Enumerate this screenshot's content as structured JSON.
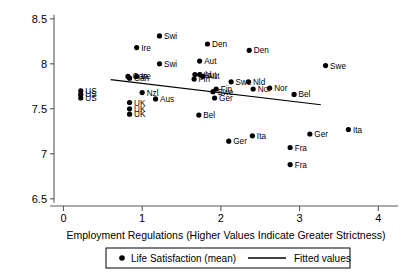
{
  "chart_data": {
    "type": "scatter",
    "title": "",
    "xlabel": "Employment Regulations (Higher Values Indicate Greater Strictness)",
    "ylabel": "",
    "xlim": [
      -0.12,
      4.25
    ],
    "ylim": [
      6.42,
      8.62
    ],
    "xticks": [
      "0",
      "1",
      "2",
      "3",
      "4"
    ],
    "xtick_values": [
      0,
      1,
      2,
      3,
      4
    ],
    "yticks": [
      "6.5",
      "7",
      "7.5",
      "8",
      "8.5"
    ],
    "ytick_values": [
      6.5,
      7,
      7.5,
      8,
      8.5
    ],
    "grid": false,
    "legend_position": "bottom-center",
    "legend": [
      {
        "marker": "circle",
        "label": "Life Satisfaction (mean)"
      },
      {
        "marker": "line",
        "label": "Fitted values"
      }
    ],
    "series": [
      {
        "name": "Life Satisfaction (mean)",
        "marker": "circle",
        "color": "#000000",
        "points": [
          {
            "label": "US",
            "x": 0.22,
            "y": 7.7
          },
          {
            "label": "US",
            "x": 0.22,
            "y": 7.66
          },
          {
            "label": "US",
            "x": 0.22,
            "y": 7.62
          },
          {
            "label": "Swi",
            "x": 1.22,
            "y": 8.31
          },
          {
            "label": "Ire",
            "x": 0.93,
            "y": 8.18
          },
          {
            "label": "Swi",
            "x": 1.22,
            "y": 8.0
          },
          {
            "label": "Can",
            "x": 0.82,
            "y": 7.86
          },
          {
            "label": "Can",
            "x": 0.84,
            "y": 7.84
          },
          {
            "label": "Ire",
            "x": 0.93,
            "y": 7.86
          },
          {
            "label": "Nzl",
            "x": 1.0,
            "y": 7.68
          },
          {
            "label": "Aus",
            "x": 1.17,
            "y": 7.61
          },
          {
            "label": "UK",
            "x": 0.84,
            "y": 7.57
          },
          {
            "label": "UK",
            "x": 0.84,
            "y": 7.5
          },
          {
            "label": "UK",
            "x": 0.84,
            "y": 7.44
          },
          {
            "label": "Den",
            "x": 1.83,
            "y": 8.22
          },
          {
            "label": "Den",
            "x": 2.36,
            "y": 8.15
          },
          {
            "label": "Aut",
            "x": 1.73,
            "y": 8.03
          },
          {
            "label": "Swe",
            "x": 3.33,
            "y": 7.98
          },
          {
            "label": "Nld",
            "x": 1.67,
            "y": 7.88
          },
          {
            "label": "Aut",
            "x": 1.73,
            "y": 7.88
          },
          {
            "label": "Fin",
            "x": 1.66,
            "y": 7.83
          },
          {
            "label": "Aut",
            "x": 1.77,
            "y": 7.86
          },
          {
            "label": "Swe",
            "x": 2.13,
            "y": 7.8
          },
          {
            "label": "Nld",
            "x": 2.35,
            "y": 7.8
          },
          {
            "label": "Fin",
            "x": 1.94,
            "y": 7.72
          },
          {
            "label": "Swe",
            "x": 1.9,
            "y": 7.69
          },
          {
            "label": "Nor",
            "x": 2.41,
            "y": 7.72
          },
          {
            "label": "Nor",
            "x": 2.62,
            "y": 7.73
          },
          {
            "label": "Bel",
            "x": 2.93,
            "y": 7.66
          },
          {
            "label": "Ger",
            "x": 1.92,
            "y": 7.62
          },
          {
            "label": "Bel",
            "x": 1.72,
            "y": 7.43
          },
          {
            "label": "Ita",
            "x": 3.62,
            "y": 7.27
          },
          {
            "label": "Ger",
            "x": 3.13,
            "y": 7.22
          },
          {
            "label": "Ita",
            "x": 2.4,
            "y": 7.2
          },
          {
            "label": "Ger",
            "x": 2.1,
            "y": 7.14
          },
          {
            "label": "Fra",
            "x": 2.88,
            "y": 7.07
          },
          {
            "label": "Fra",
            "x": 2.88,
            "y": 6.88
          }
        ]
      }
    ],
    "fitted_line": {
      "name": "Fitted values",
      "x_start": 0.6,
      "y_start": 7.825,
      "x_end": 3.27,
      "y_end": 7.545
    }
  }
}
